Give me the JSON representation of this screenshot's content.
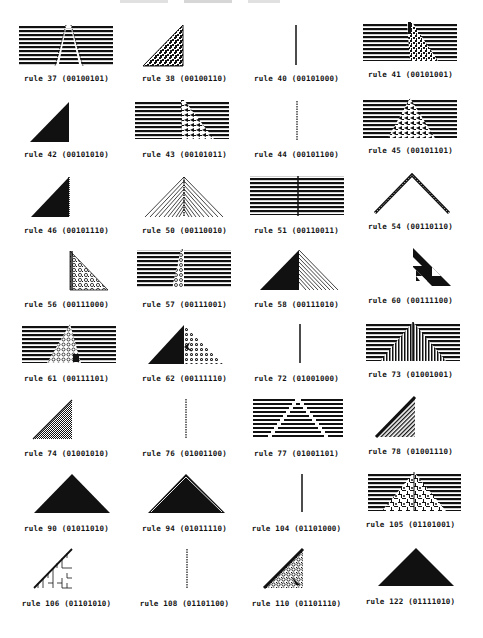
{
  "page": {
    "header_fragment": "",
    "grid": {
      "columns": 4,
      "rows": 8
    }
  },
  "rules": [
    {
      "rule": 37,
      "binary": "00100101",
      "label": "rule 37 (00100101)",
      "pattern": "stripes-triangle-hollow"
    },
    {
      "rule": 38,
      "binary": "00100110",
      "label": "rule 38 (00100110)",
      "pattern": "left-triangle-chaotic"
    },
    {
      "rule": 40,
      "binary": "00101000",
      "label": "rule 40 (00101000)",
      "pattern": "vertical-line"
    },
    {
      "rule": 41,
      "binary": "00101001",
      "label": "rule 41 (00101001)",
      "pattern": "stripes-right-chaotic"
    },
    {
      "rule": 42,
      "binary": "00101010",
      "label": "rule 42 (00101010)",
      "pattern": "left-triangle-solid"
    },
    {
      "rule": 43,
      "binary": "00101011",
      "label": "rule 43 (00101011)",
      "pattern": "stripes-right-chaotic"
    },
    {
      "rule": 44,
      "binary": "00101100",
      "label": "rule 44 (00101100)",
      "pattern": "vertical-dotted-line"
    },
    {
      "rule": 45,
      "binary": "00101101",
      "label": "rule 45 (00101101)",
      "pattern": "stripes-triangle-chaotic"
    },
    {
      "rule": 46,
      "binary": "00101110",
      "label": "rule 46 (00101110)",
      "pattern": "left-triangle-solid"
    },
    {
      "rule": 50,
      "binary": "00110010",
      "label": "rule 50 (00110010)",
      "pattern": "triangle-hatched"
    },
    {
      "rule": 51,
      "binary": "00110011",
      "label": "rule 51 (00110011)",
      "pattern": "stripes-vertical-line"
    },
    {
      "rule": 54,
      "binary": "00110110",
      "label": "rule 54 (00110110)",
      "pattern": "chevron-edges"
    },
    {
      "rule": 56,
      "binary": "00111000",
      "label": "rule 56 (00111000)",
      "pattern": "right-triangle-chaotic"
    },
    {
      "rule": 57,
      "binary": "00111001",
      "label": "rule 57 (00111001)",
      "pattern": "stripes-shifted-chaotic"
    },
    {
      "rule": 58,
      "binary": "00111010",
      "label": "rule 58 (00111010)",
      "pattern": "triangle-half-solid-half-hatched"
    },
    {
      "rule": 60,
      "binary": "00111100",
      "label": "rule 60 (00111100)",
      "pattern": "right-triangle-sierpinski"
    },
    {
      "rule": 61,
      "binary": "00111101",
      "label": "rule 61 (00111101)",
      "pattern": "stripes-triangle-chaotic"
    },
    {
      "rule": 62,
      "binary": "00111110",
      "label": "rule 62 (00111110)",
      "pattern": "triangle-half-solid-half-chaotic"
    },
    {
      "rule": 72,
      "binary": "01001000",
      "label": "rule 72 (01001000)",
      "pattern": "vertical-line"
    },
    {
      "rule": 73,
      "binary": "01001001",
      "label": "rule 73 (01001001)",
      "pattern": "stripes-triangle-steps"
    },
    {
      "rule": 74,
      "binary": "01001010",
      "label": "rule 74 (01001010)",
      "pattern": "left-triangle-hatched"
    },
    {
      "rule": 76,
      "binary": "01001100",
      "label": "rule 76 (01001100)",
      "pattern": "vertical-dotted-line"
    },
    {
      "rule": 77,
      "binary": "01001101",
      "label": "rule 77 (01001101)",
      "pattern": "stripes-stepped-pyramid"
    },
    {
      "rule": 78,
      "binary": "01001110",
      "label": "rule 78 (01001110)",
      "pattern": "left-triangle-hatched-edge"
    },
    {
      "rule": 90,
      "binary": "01011010",
      "label": "rule 90 (01011010)",
      "pattern": "triangle-solid"
    },
    {
      "rule": 94,
      "binary": "01011110",
      "label": "rule 94 (01011110)",
      "pattern": "triangle-solid-outlined"
    },
    {
      "rule": 104,
      "binary": "01101000",
      "label": "rule 104 (01101000)",
      "pattern": "vertical-line"
    },
    {
      "rule": 105,
      "binary": "01101001",
      "label": "rule 105 (01101001)",
      "pattern": "stripes-triangle-fractal"
    },
    {
      "rule": 106,
      "binary": "01101010",
      "label": "rule 106 (01101010)",
      "pattern": "left-triangle-sierpinski"
    },
    {
      "rule": 108,
      "binary": "01101100",
      "label": "rule 108 (01101100)",
      "pattern": "vertical-dotted-line"
    },
    {
      "rule": 110,
      "binary": "01101110",
      "label": "rule 110 (01101110)",
      "pattern": "left-triangle-chaotic-edge"
    },
    {
      "rule": 122,
      "binary": "01111010",
      "label": "rule 122 (01111010)",
      "pattern": "triangle-solid"
    }
  ]
}
